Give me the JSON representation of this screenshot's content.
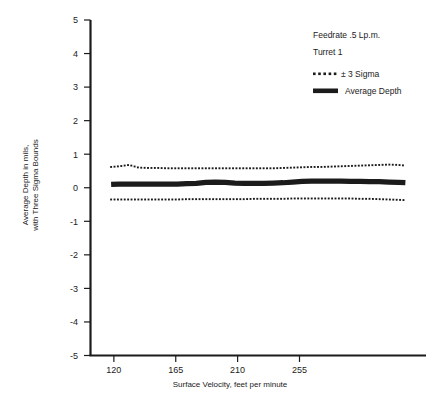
{
  "chart_data": {
    "type": "line",
    "title": "",
    "xlabel": "Surface Velocity, feet per minute",
    "ylabel_line1": "Average Depth in mils,",
    "ylabel_line2": "with Three Sigma Bounds",
    "xlim": [
      103,
      347
    ],
    "ylim": [
      -5,
      5
    ],
    "xticks": [
      120,
      165,
      210,
      255
    ],
    "xtick_labels": [
      "120",
      "165",
      "210",
      "255"
    ],
    "yticks": [
      5,
      4,
      3,
      2,
      1,
      0,
      -1,
      -2,
      -3,
      -4,
      -5
    ],
    "ytick_labels": [
      "5",
      "4",
      "3",
      "2",
      "1",
      "0",
      "-1",
      "-2",
      "-3",
      "-4",
      "-5"
    ],
    "grid": false,
    "legend_position": "upper-right",
    "x": [
      118,
      124,
      131,
      138,
      145,
      152,
      159,
      166,
      173,
      180,
      187,
      194,
      201,
      208,
      215,
      222,
      229,
      236,
      243,
      250,
      257,
      264,
      271,
      278,
      285,
      292,
      299,
      306,
      313,
      320,
      327,
      332
    ],
    "series": [
      {
        "name": "+ 3 Sigma",
        "style": "dotted",
        "values": [
          0.62,
          0.64,
          0.68,
          0.6,
          0.59,
          0.59,
          0.58,
          0.58,
          0.58,
          0.58,
          0.58,
          0.58,
          0.58,
          0.58,
          0.58,
          0.58,
          0.58,
          0.58,
          0.59,
          0.6,
          0.61,
          0.62,
          0.62,
          0.63,
          0.64,
          0.65,
          0.66,
          0.67,
          0.68,
          0.69,
          0.68,
          0.66
        ]
      },
      {
        "name": "Average Depth",
        "style": "solid-thick",
        "values": [
          0.1,
          0.11,
          0.11,
          0.11,
          0.11,
          0.11,
          0.11,
          0.11,
          0.12,
          0.13,
          0.16,
          0.17,
          0.16,
          0.14,
          0.13,
          0.13,
          0.13,
          0.14,
          0.15,
          0.17,
          0.19,
          0.2,
          0.2,
          0.2,
          0.2,
          0.19,
          0.19,
          0.18,
          0.18,
          0.17,
          0.16,
          0.15
        ]
      },
      {
        "name": "- 3 Sigma",
        "style": "dotted",
        "values": [
          -0.35,
          -0.35,
          -0.35,
          -0.35,
          -0.35,
          -0.35,
          -0.35,
          -0.35,
          -0.34,
          -0.34,
          -0.34,
          -0.34,
          -0.34,
          -0.34,
          -0.34,
          -0.33,
          -0.33,
          -0.33,
          -0.33,
          -0.32,
          -0.32,
          -0.32,
          -0.32,
          -0.32,
          -0.32,
          -0.32,
          -0.33,
          -0.33,
          -0.34,
          -0.35,
          -0.36,
          -0.37
        ]
      }
    ]
  },
  "legend": {
    "note_line1": "Feedrate .5 Lp.m.",
    "note_line2": "Turret 1",
    "entry_sigma": "± 3 Sigma",
    "entry_average": "Average Depth"
  },
  "colors": {
    "ink": "#1b1b1b",
    "background": "#ffffff"
  }
}
